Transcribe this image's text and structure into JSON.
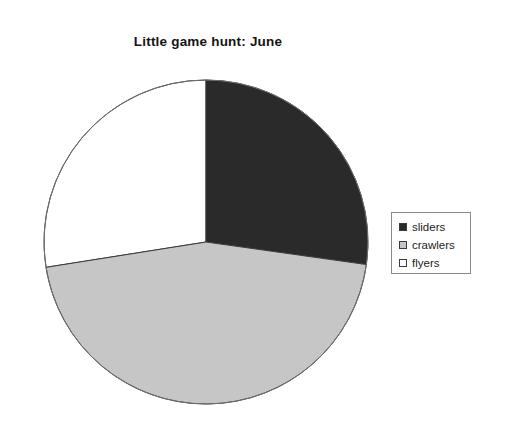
{
  "chart_data": {
    "type": "pie",
    "title": "Little game hunt: June",
    "xlabel": "",
    "ylabel": "",
    "categories": [
      "sliders",
      "crawlers",
      "flyers"
    ],
    "values": [
      27,
      45,
      28
    ],
    "units": "percent",
    "slice_angles_deg": [
      98,
      163,
      99
    ],
    "start_angle_deg": 0,
    "direction": "clockwise",
    "colors": [
      "#2a2a2a",
      "#c6c6c6",
      "#ffffff"
    ],
    "slice_edge_color": "#3a3a3a",
    "legend": {
      "position": "right",
      "entries": [
        {
          "label": "sliders",
          "color": "#2a2a2a"
        },
        {
          "label": "crawlers",
          "color": "#c6c6c6"
        },
        {
          "label": "flyers",
          "color": "#ffffff"
        }
      ]
    },
    "grid": false,
    "background": "#ffffff"
  },
  "figure": {
    "title": "Little game hunt: June",
    "pie": {
      "center_x": 163,
      "center_y": 163,
      "radius": 162
    }
  }
}
